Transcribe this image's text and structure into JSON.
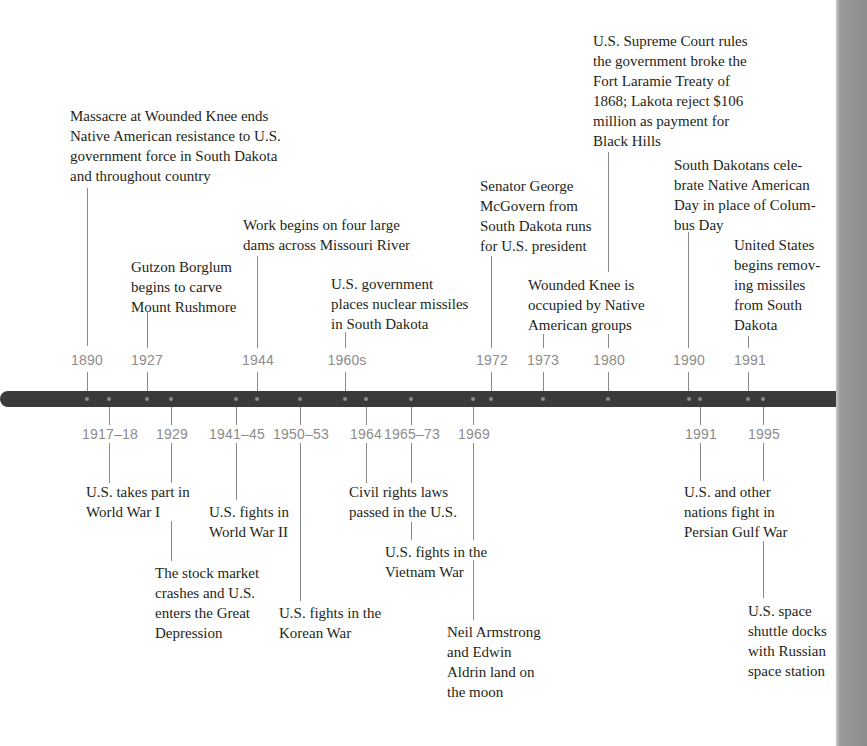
{
  "timeline": {
    "colors": {
      "bar": "#3a3a3a",
      "year_text": "#8c8c8c",
      "tick": "#8a8a8a",
      "label_text": "#231f20",
      "page_edge": "#8c8c8c"
    },
    "above": [
      {
        "year": "1890",
        "lines": [
          "Massacre at Wounded Knee ends",
          "Native American resistance to U.S.",
          "government force in South Dakota",
          "and throughout country"
        ]
      },
      {
        "year": "1927",
        "lines": [
          "Gutzon Borglum",
          "begins to carve",
          "Mount Rushmore"
        ]
      },
      {
        "year": "1944",
        "lines": [
          "Work begins on four large",
          "dams across Missouri River"
        ]
      },
      {
        "year": "1960s",
        "lines": [
          "U.S. government",
          "places nuclear missiles",
          "in South Dakota"
        ]
      },
      {
        "year": "1972",
        "lines": [
          "Senator George",
          "McGovern from",
          "South Dakota runs",
          "for U.S. president"
        ]
      },
      {
        "year": "1973",
        "lines": [
          "Wounded Knee is",
          "occupied by Native",
          "American groups"
        ]
      },
      {
        "year": "1980",
        "lines": [
          "U.S. Supreme Court rules",
          "the government broke the",
          "Fort Laramie Treaty of",
          "1868; Lakota reject $106",
          "million as payment for",
          "Black Hills"
        ]
      },
      {
        "year": "1990",
        "lines": [
          "South Dakotans cele-",
          "brate Native American",
          "Day in place of Colum-",
          "bus Day"
        ]
      },
      {
        "year": "1991",
        "lines": [
          "United States",
          "begins remov-",
          "ing missiles",
          "from South",
          "Dakota"
        ]
      }
    ],
    "below": [
      {
        "year": "1917–18",
        "lines": [
          "U.S. takes part in",
          "World War I"
        ]
      },
      {
        "year": "1929",
        "lines": [
          "The stock market",
          "crashes and U.S.",
          "enters the Great",
          "Depression"
        ]
      },
      {
        "year": "1941–45",
        "lines": [
          "U.S. fights in",
          "World War II"
        ]
      },
      {
        "year": "1950–53",
        "lines": [
          "U.S. fights in the",
          "Korean War"
        ]
      },
      {
        "year": "1964",
        "lines": [
          "Civil rights laws",
          "passed in the U.S."
        ]
      },
      {
        "year": "1965–73",
        "lines": [
          "U.S. fights in the",
          "Vietnam War"
        ]
      },
      {
        "year": "1969",
        "lines": [
          "Neil Armstrong",
          "and Edwin",
          "Aldrin land on",
          "the moon"
        ]
      },
      {
        "year": "1991",
        "lines": [
          "U.S. and other",
          "nations fight in",
          "Persian Gulf War"
        ]
      },
      {
        "year": "1995",
        "lines": [
          "U.S. space",
          "shuttle docks",
          "with Russian",
          "space station"
        ]
      }
    ]
  }
}
